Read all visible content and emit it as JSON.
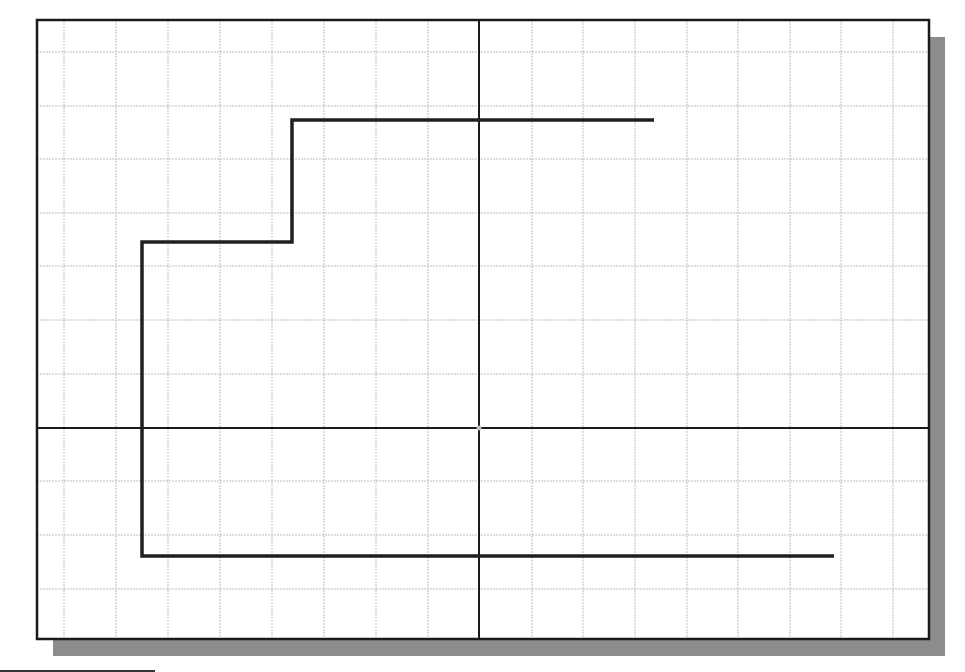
{
  "canvas": {
    "width": 965,
    "height": 672,
    "background": "#ffffff"
  },
  "frame": {
    "x": 37,
    "y": 20,
    "width": 892,
    "height": 619,
    "stroke": "#1a1a1a",
    "stroke_width": 2.5
  },
  "shadow": {
    "offset_x": 16,
    "offset_y": 17,
    "color": "#8c8c8c"
  },
  "grid": {
    "color": "#bdbdbd",
    "dash": "2,1",
    "x_lines": [
      64,
      116,
      168,
      220,
      272,
      324,
      376,
      428,
      532,
      583,
      635,
      687,
      738,
      790,
      841,
      893
    ],
    "y_lines": [
      52,
      106,
      159,
      213,
      266,
      320,
      374,
      481,
      535,
      589
    ]
  },
  "axes": {
    "origin": {
      "x": 479,
      "y": 428
    },
    "color": "#1a1a1a",
    "stroke_width": 2,
    "origin_marker_color": "#bfbfbf"
  },
  "polyline": {
    "color": "#1f1f1f",
    "stroke_width": 3.5,
    "points": [
      [
        654,
        120
      ],
      [
        292,
        120
      ],
      [
        292,
        242
      ],
      [
        142,
        242
      ],
      [
        142,
        556
      ],
      [
        834,
        556
      ]
    ]
  },
  "bottom_edge_line": {
    "x1": 0,
    "x2": 155,
    "y": 671,
    "color": "#333333"
  }
}
